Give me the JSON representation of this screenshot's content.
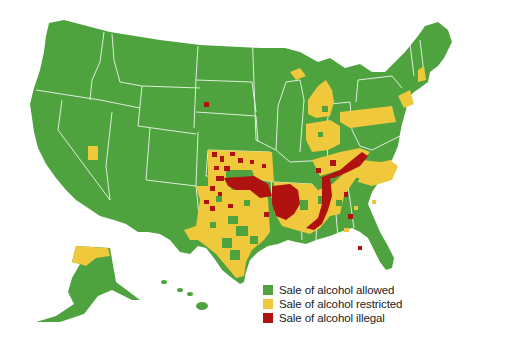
{
  "map": {
    "title": "",
    "subject": "United States counties by legality of alcohol sale",
    "colors": {
      "allowed": "#4fa33f",
      "restricted": "#f0c83c",
      "illegal": "#b0120f",
      "border": "#ffffff",
      "background": "#ffffff"
    }
  },
  "legend": {
    "items": [
      {
        "label": "Sale of alcohol allowed",
        "color": "#4fa33f",
        "key": "allowed"
      },
      {
        "label": "Sale of alcohol restricted",
        "color": "#f0c83c",
        "key": "restricted"
      },
      {
        "label": "Sale of alcohol illegal",
        "color": "#b0120f",
        "key": "illegal"
      }
    ]
  }
}
